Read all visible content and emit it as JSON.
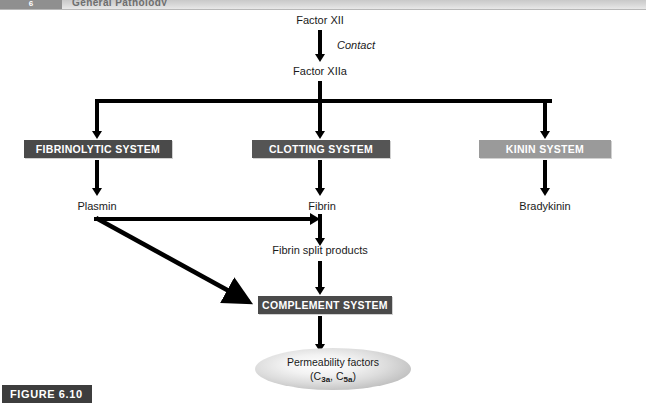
{
  "header": {
    "chapter_tab": "6",
    "title": "General Pathology"
  },
  "figure": {
    "tag": "FIGURE 6.10"
  },
  "diagram": {
    "nodes": {
      "factor_xii": "Factor XII",
      "contact": "Contact",
      "factor_xiia": "Factor XIIa",
      "plasmin": "Plasmin",
      "fibrin": "Fibrin",
      "bradykinin": "Bradykinin",
      "fibrin_split_products": "Fibrin split products"
    },
    "boxes": {
      "fibrinolytic_system": "FIBRINOLYTIC SYSTEM",
      "clotting_system": "CLOTTING SYSTEM",
      "kinin_system": "KININ SYSTEM",
      "complement_system": "COMPLEMENT SYSTEM"
    },
    "outcome": {
      "line1": "Permeability factors",
      "c3a_prefix": "(C",
      "c3a_sub": "3a",
      "c3a_mid": ", C",
      "c5a_sub": "5a",
      "c5a_suffix": ")"
    },
    "colors": {
      "box_dark": "#4a4a4a",
      "box_darker": "#555555",
      "box_light": "#9a9a9a",
      "arrow": "#000000",
      "figure_tag": "#3d3d3d"
    }
  }
}
